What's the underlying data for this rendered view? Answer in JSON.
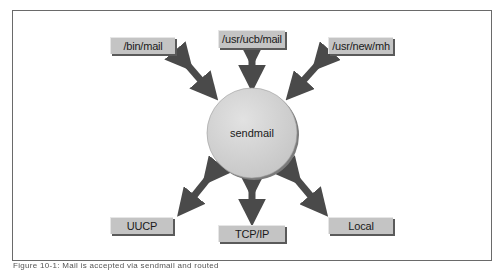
{
  "diagram": {
    "center": {
      "label": "sendmail",
      "color": "#d2d2d2"
    },
    "top_nodes": [
      {
        "label": "/bin/mail"
      },
      {
        "label": "/usr/ucb/mail"
      },
      {
        "label": "/usr/new/mh"
      }
    ],
    "bottom_nodes": [
      {
        "label": "UUCP"
      },
      {
        "label": "TCP/IP"
      },
      {
        "label": "Local"
      }
    ],
    "arrow_color": "#4a4a4a",
    "node_color": "#c4c4c4"
  },
  "caption": "Figure 10-1: Mail is accepted via sendmail and routed"
}
